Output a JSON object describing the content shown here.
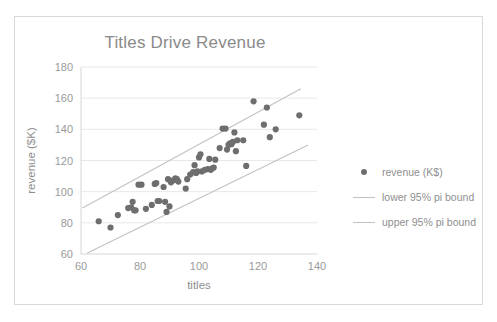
{
  "chart_data": {
    "type": "scatter",
    "title": "Titles Drive Revenue",
    "xlabel": "titles",
    "ylabel": "revenue ($K)",
    "xlim": [
      60,
      140
    ],
    "ylim": [
      60,
      180
    ],
    "xticks": [
      60,
      80,
      100,
      120,
      140
    ],
    "yticks": [
      60,
      80,
      100,
      120,
      140,
      160,
      180
    ],
    "grid": "horizontal",
    "legend_position": "right",
    "series": [
      {
        "name": "revenue (K$)",
        "type": "scatter",
        "color": "#6e6e6e",
        "points": [
          [
            66,
            81
          ],
          [
            70,
            77
          ],
          [
            72.5,
            85
          ],
          [
            76,
            89.5
          ],
          [
            77,
            90
          ],
          [
            77.5,
            93.5
          ],
          [
            78,
            88
          ],
          [
            78.5,
            88
          ],
          [
            79.5,
            104.5
          ],
          [
            80.5,
            104.5
          ],
          [
            82,
            89
          ],
          [
            84,
            91.5
          ],
          [
            85,
            105
          ],
          [
            85.5,
            105.5
          ],
          [
            86,
            94
          ],
          [
            86.5,
            94
          ],
          [
            88,
            103
          ],
          [
            88.5,
            93.5
          ],
          [
            89,
            87
          ],
          [
            89.5,
            108
          ],
          [
            90,
            90.5
          ],
          [
            90.5,
            106
          ],
          [
            91,
            107
          ],
          [
            91.5,
            107.5
          ],
          [
            92,
            108.5
          ],
          [
            92.5,
            108
          ],
          [
            93,
            106.5
          ],
          [
            95.5,
            102
          ],
          [
            96,
            108
          ],
          [
            97,
            111
          ],
          [
            98,
            112.5
          ],
          [
            98.5,
            117
          ],
          [
            99,
            112
          ],
          [
            99.5,
            113
          ],
          [
            100,
            122
          ],
          [
            100.5,
            124
          ],
          [
            101,
            113
          ],
          [
            102,
            114
          ],
          [
            103,
            114.5
          ],
          [
            103.5,
            121
          ],
          [
            104,
            114
          ],
          [
            104.5,
            115
          ],
          [
            105,
            115.5
          ],
          [
            105.5,
            120.5
          ],
          [
            107,
            128
          ],
          [
            108,
            140.5
          ],
          [
            109,
            140.5
          ],
          [
            109.5,
            127
          ],
          [
            110,
            130
          ],
          [
            110.5,
            131
          ],
          [
            111,
            130.5
          ],
          [
            111.5,
            132
          ],
          [
            112,
            138
          ],
          [
            112.5,
            126
          ],
          [
            113,
            133
          ],
          [
            115,
            133
          ],
          [
            116,
            116.5
          ],
          [
            118.5,
            158
          ],
          [
            122,
            143
          ],
          [
            123,
            154
          ],
          [
            124,
            135
          ],
          [
            126,
            140
          ],
          [
            134,
            149
          ]
        ]
      },
      {
        "name": "lower 95% pi bound",
        "type": "line",
        "color": "#c2c2c2",
        "endpoints": [
          [
            62,
            60.5
          ],
          [
            137,
            130
          ]
        ]
      },
      {
        "name": "upper 95% pi bound",
        "type": "line",
        "color": "#c2c2c2",
        "endpoints": [
          [
            60.5,
            89.5
          ],
          [
            134.5,
            166
          ]
        ]
      }
    ]
  },
  "legend": {
    "items": [
      {
        "label": "revenue (K$)",
        "marker": "dot"
      },
      {
        "label": "lower 95% pi bound",
        "marker": "line"
      },
      {
        "label": "upper 95% pi bound",
        "marker": "line"
      }
    ]
  },
  "colors": {
    "point": "#6e6e6e",
    "pi_line": "#c2c2c2",
    "grid": "#e8e8e8",
    "text": "#8f8f8f",
    "frame": "#d9d9d9"
  }
}
